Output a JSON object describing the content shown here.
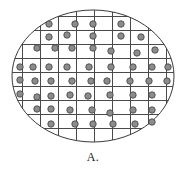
{
  "figure": {
    "caption": "A.",
    "type": "wafer-map"
  },
  "colors": {
    "background": "#ffffff",
    "wafer_outline": "#3a3a3a",
    "grid_line": "#4a4a4a",
    "dot_fill": "#8c8c8c",
    "dot_stroke": "#4a4a4a",
    "caption_text": "#1a1a1a"
  },
  "chart_data": {
    "type": "scatter",
    "title": "A.",
    "xlabel": "",
    "ylabel": "",
    "xlim": [
      0,
      186
    ],
    "ylim": [
      0,
      152
    ],
    "grid": true,
    "legend": null,
    "ellipse": {
      "cx": 93,
      "cy": 76,
      "rx": 81,
      "ry": 66,
      "stroke_width": 1
    },
    "grid_lines": {
      "vertical_x": [
        22,
        40,
        58,
        76,
        94,
        112,
        130,
        148,
        166
      ],
      "horizontal_y": [
        16,
        30,
        44,
        58,
        72,
        86,
        100,
        114,
        128,
        142
      ],
      "cell_width": 18,
      "cell_height": 14
    },
    "dot_radius": 3.2,
    "rows": [
      {
        "row": 1,
        "count": 4,
        "points": [
          {
            "x": 49,
            "y": 24
          },
          {
            "x": 75,
            "y": 24
          },
          {
            "x": 93,
            "y": 24
          },
          {
            "x": 121,
            "y": 24
          }
        ]
      },
      {
        "row": 2,
        "count": 5,
        "points": [
          {
            "x": 49,
            "y": 37
          },
          {
            "x": 67,
            "y": 35
          },
          {
            "x": 93,
            "y": 36
          },
          {
            "x": 121,
            "y": 36
          },
          {
            "x": 141,
            "y": 37
          }
        ]
      },
      {
        "row": 3,
        "count": 7,
        "points": [
          {
            "x": 37,
            "y": 48
          },
          {
            "x": 55,
            "y": 48
          },
          {
            "x": 72,
            "y": 48
          },
          {
            "x": 93,
            "y": 48
          },
          {
            "x": 111,
            "y": 51
          },
          {
            "x": 137,
            "y": 53
          },
          {
            "x": 155,
            "y": 50
          }
        ]
      },
      {
        "row": 4,
        "count": 9,
        "points": [
          {
            "x": 20,
            "y": 67
          },
          {
            "x": 33,
            "y": 67
          },
          {
            "x": 49,
            "y": 67
          },
          {
            "x": 67,
            "y": 67
          },
          {
            "x": 89,
            "y": 67
          },
          {
            "x": 111,
            "y": 67
          },
          {
            "x": 133,
            "y": 67
          },
          {
            "x": 152,
            "y": 67
          },
          {
            "x": 168,
            "y": 67
          }
        ]
      },
      {
        "row": 5,
        "count": 9,
        "points": [
          {
            "x": 20,
            "y": 80
          },
          {
            "x": 35,
            "y": 81
          },
          {
            "x": 51,
            "y": 81
          },
          {
            "x": 72,
            "y": 81
          },
          {
            "x": 91,
            "y": 81
          },
          {
            "x": 107,
            "y": 81
          },
          {
            "x": 130,
            "y": 81
          },
          {
            "x": 149,
            "y": 81
          },
          {
            "x": 167,
            "y": 81
          }
        ]
      },
      {
        "row": 6,
        "count": 8,
        "points": [
          {
            "x": 20,
            "y": 94
          },
          {
            "x": 37,
            "y": 97
          },
          {
            "x": 51,
            "y": 96
          },
          {
            "x": 70,
            "y": 95
          },
          {
            "x": 88,
            "y": 96
          },
          {
            "x": 110,
            "y": 95
          },
          {
            "x": 133,
            "y": 95
          },
          {
            "x": 152,
            "y": 95
          }
        ]
      },
      {
        "row": 7,
        "count": 7,
        "points": [
          {
            "x": 37,
            "y": 109
          },
          {
            "x": 51,
            "y": 109
          },
          {
            "x": 70,
            "y": 110
          },
          {
            "x": 92,
            "y": 110
          },
          {
            "x": 110,
            "y": 113
          },
          {
            "x": 133,
            "y": 110
          },
          {
            "x": 152,
            "y": 110
          }
        ]
      },
      {
        "row": 8,
        "count": 6,
        "points": [
          {
            "x": 51,
            "y": 124
          },
          {
            "x": 75,
            "y": 124
          },
          {
            "x": 93,
            "y": 124
          },
          {
            "x": 113,
            "y": 124
          },
          {
            "x": 135,
            "y": 124
          },
          {
            "x": 152,
            "y": 122
          }
        ]
      }
    ]
  }
}
